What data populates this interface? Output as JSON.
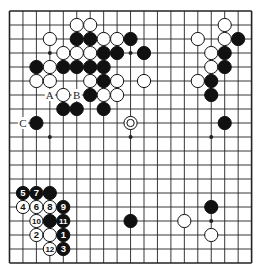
{
  "diagram": {
    "type": "go-board",
    "size": 19,
    "colors": {
      "black": "#111111",
      "white": "#ffffff",
      "line": "#222222",
      "background": "#ffffff"
    },
    "geometry": {
      "x0": 9.5,
      "y0": 11,
      "dx": 13.45,
      "dy": 14.0,
      "stone_r": 6.6
    },
    "star_points": [
      [
        4,
        4
      ],
      [
        4,
        10
      ],
      [
        4,
        16
      ],
      [
        10,
        4
      ],
      [
        10,
        10
      ],
      [
        10,
        16
      ],
      [
        16,
        4
      ],
      [
        16,
        10
      ],
      [
        16,
        16
      ]
    ],
    "stones": [
      {
        "row": 2,
        "col": 6,
        "color": "white"
      },
      {
        "row": 2,
        "col": 7,
        "color": "white"
      },
      {
        "row": 2,
        "col": 17,
        "color": "white"
      },
      {
        "row": 3,
        "col": 4,
        "color": "white"
      },
      {
        "row": 3,
        "col": 6,
        "color": "black"
      },
      {
        "row": 3,
        "col": 7,
        "color": "black"
      },
      {
        "row": 3,
        "col": 8,
        "color": "white"
      },
      {
        "row": 3,
        "col": 9,
        "color": "white"
      },
      {
        "row": 3,
        "col": 10,
        "color": "black"
      },
      {
        "row": 3,
        "col": 15,
        "color": "white"
      },
      {
        "row": 3,
        "col": 17,
        "color": "white"
      },
      {
        "row": 3,
        "col": 18,
        "color": "black"
      },
      {
        "row": 4,
        "col": 5,
        "color": "white"
      },
      {
        "row": 4,
        "col": 6,
        "color": "white"
      },
      {
        "row": 4,
        "col": 7,
        "color": "white"
      },
      {
        "row": 4,
        "col": 8,
        "color": "black"
      },
      {
        "row": 4,
        "col": 9,
        "color": "black"
      },
      {
        "row": 4,
        "col": 11,
        "color": "black"
      },
      {
        "row": 4,
        "col": 16,
        "color": "white"
      },
      {
        "row": 4,
        "col": 17,
        "color": "black"
      },
      {
        "row": 5,
        "col": 3,
        "color": "black"
      },
      {
        "row": 5,
        "col": 4,
        "color": "white"
      },
      {
        "row": 5,
        "col": 5,
        "color": "black"
      },
      {
        "row": 5,
        "col": 6,
        "color": "black"
      },
      {
        "row": 5,
        "col": 7,
        "color": "black"
      },
      {
        "row": 5,
        "col": 8,
        "color": "black"
      },
      {
        "row": 5,
        "col": 16,
        "color": "white"
      },
      {
        "row": 5,
        "col": 17,
        "color": "black"
      },
      {
        "row": 6,
        "col": 3,
        "color": "white"
      },
      {
        "row": 6,
        "col": 4,
        "color": "white"
      },
      {
        "row": 6,
        "col": 7,
        "color": "white"
      },
      {
        "row": 6,
        "col": 8,
        "color": "black"
      },
      {
        "row": 6,
        "col": 9,
        "color": "white"
      },
      {
        "row": 6,
        "col": 11,
        "color": "white"
      },
      {
        "row": 6,
        "col": 15,
        "color": "white"
      },
      {
        "row": 6,
        "col": 16,
        "color": "black"
      },
      {
        "row": 7,
        "col": 5,
        "color": "white"
      },
      {
        "row": 7,
        "col": 7,
        "color": "black"
      },
      {
        "row": 7,
        "col": 8,
        "color": "white"
      },
      {
        "row": 7,
        "col": 9,
        "color": "white"
      },
      {
        "row": 7,
        "col": 16,
        "color": "black"
      },
      {
        "row": 8,
        "col": 5,
        "color": "black"
      },
      {
        "row": 8,
        "col": 6,
        "color": "black"
      },
      {
        "row": 8,
        "col": 8,
        "color": "black"
      },
      {
        "row": 9,
        "col": 3,
        "color": "black"
      },
      {
        "row": 9,
        "col": 10,
        "color": "white",
        "marker": "circle"
      },
      {
        "row": 9,
        "col": 17,
        "color": "black"
      },
      {
        "row": 14,
        "col": 2,
        "color": "black",
        "label": "5"
      },
      {
        "row": 14,
        "col": 3,
        "color": "black",
        "label": "7"
      },
      {
        "row": 14,
        "col": 4,
        "color": "black"
      },
      {
        "row": 15,
        "col": 2,
        "color": "white",
        "label": "4"
      },
      {
        "row": 15,
        "col": 3,
        "color": "white",
        "label": "6"
      },
      {
        "row": 15,
        "col": 4,
        "color": "white",
        "label": "8"
      },
      {
        "row": 15,
        "col": 5,
        "color": "black",
        "label": "9"
      },
      {
        "row": 15,
        "col": 16,
        "color": "black"
      },
      {
        "row": 16,
        "col": 3,
        "color": "white",
        "label": "10"
      },
      {
        "row": 16,
        "col": 4,
        "color": "black"
      },
      {
        "row": 16,
        "col": 5,
        "color": "black",
        "label": "11"
      },
      {
        "row": 16,
        "col": 10,
        "color": "black"
      },
      {
        "row": 16,
        "col": 14,
        "color": "white"
      },
      {
        "row": 17,
        "col": 3,
        "color": "white",
        "label": "2"
      },
      {
        "row": 17,
        "col": 4,
        "color": "white"
      },
      {
        "row": 17,
        "col": 5,
        "color": "black",
        "label": "1"
      },
      {
        "row": 17,
        "col": 16,
        "color": "white"
      },
      {
        "row": 18,
        "col": 4,
        "color": "white",
        "label": "12"
      },
      {
        "row": 18,
        "col": 5,
        "color": "black",
        "label": "3"
      }
    ],
    "point_labels": [
      {
        "row": 7,
        "col": 4,
        "text": "A"
      },
      {
        "row": 7,
        "col": 6,
        "text": "B"
      },
      {
        "row": 9,
        "col": 2,
        "text": "C"
      }
    ]
  }
}
